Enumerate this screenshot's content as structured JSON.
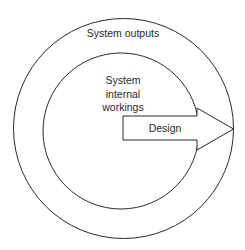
{
  "diagram": {
    "outer_ring_label": "System outputs",
    "inner_circle_label_lines": [
      "System",
      "internal",
      "workings"
    ],
    "arrow_label": "Design"
  },
  "colors": {
    "stroke": "#2a2a2a",
    "background": "#ffffff"
  }
}
